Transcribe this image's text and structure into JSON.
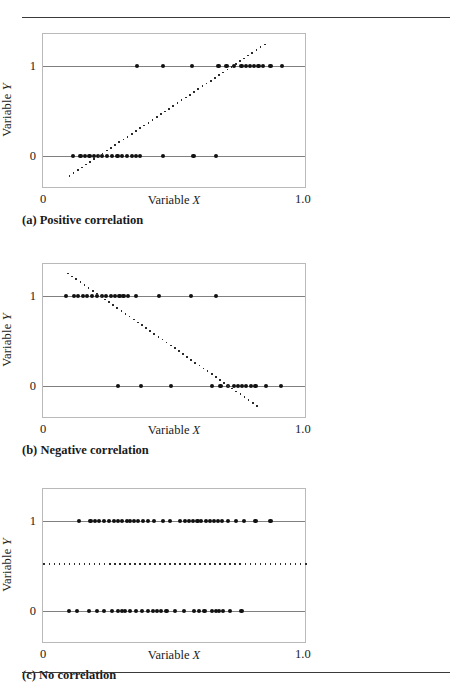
{
  "figure": {
    "rules": {
      "top": true,
      "bottom": true
    }
  },
  "panels": [
    {
      "id": "a",
      "caption": "(a) Positive correlation",
      "axis": {
        "xlabel_prefix": "Variable ",
        "xlabel_var": "X",
        "ylabel_prefix": "Variable ",
        "ylabel_var": "Y",
        "xticks": [
          "0",
          "1.0"
        ],
        "yticks": [
          "1",
          "0"
        ],
        "xlim": [
          0,
          1.0
        ],
        "ylim": [
          -0.28,
          1.28
        ]
      },
      "chart_data": {
        "type": "scatter",
        "title": "(a) Positive correlation",
        "xlabel": "Variable X",
        "ylabel": "Variable Y",
        "xlim": [
          0,
          1.0
        ],
        "ylim": [
          -0.28,
          1.28
        ],
        "grid": false,
        "legend": "none",
        "series": [
          {
            "name": "y = 1 observations",
            "y": 1,
            "x": [
              0.355,
              0.455,
              0.565,
              0.665,
              0.695,
              0.725,
              0.752,
              0.768,
              0.784,
              0.8,
              0.816,
              0.832,
              0.862,
              0.905
            ]
          },
          {
            "name": "y = 0 observations",
            "y": 0,
            "x": [
              0.115,
              0.142,
              0.158,
              0.176,
              0.192,
              0.208,
              0.224,
              0.243,
              0.262,
              0.282,
              0.3,
              0.318,
              0.336,
              0.352,
              0.368,
              0.455,
              0.57,
              0.655
            ]
          }
        ],
        "trendline": {
          "style": "dotted",
          "x0": 0.1,
          "y0": -0.22,
          "x1": 0.84,
          "y1": 1.24
        }
      }
    },
    {
      "id": "b",
      "caption": "(b) Negative correlation",
      "axis": {
        "xlabel_prefix": "Variable ",
        "xlabel_var": "X",
        "ylabel_prefix": "Variable ",
        "ylabel_var": "Y",
        "xticks": [
          "0",
          "1.0"
        ],
        "yticks": [
          "1",
          "0"
        ],
        "xlim": [
          0,
          1.0
        ],
        "ylim": [
          -0.28,
          1.28
        ]
      },
      "chart_data": {
        "type": "scatter",
        "title": "(b) Negative correlation",
        "xlabel": "Variable X",
        "ylabel": "Variable Y",
        "xlim": [
          0,
          1.0
        ],
        "ylim": [
          -0.28,
          1.28
        ],
        "grid": false,
        "legend": "none",
        "series": [
          {
            "name": "y = 1 observations",
            "y": 1,
            "x": [
              0.088,
              0.118,
              0.134,
              0.15,
              0.168,
              0.186,
              0.205,
              0.222,
              0.24,
              0.258,
              0.272,
              0.29,
              0.305,
              0.322,
              0.352,
              0.44,
              0.56,
              0.655
            ]
          },
          {
            "name": "y = 0 observations",
            "y": 0,
            "x": [
              0.285,
              0.372,
              0.485,
              0.64,
              0.672,
              0.7,
              0.725,
              0.74,
              0.755,
              0.77,
              0.788,
              0.805,
              0.845,
              0.9
            ]
          }
        ],
        "trendline": {
          "style": "dotted",
          "x0": 0.095,
          "y0": 1.25,
          "x1": 0.81,
          "y1": -0.22
        }
      }
    },
    {
      "id": "c",
      "caption": "(c) No correlation",
      "axis": {
        "xlabel_prefix": "Variable ",
        "xlabel_var": "X",
        "ylabel_prefix": "Variable ",
        "ylabel_var": "Y",
        "xticks": [
          "0",
          "1.0"
        ],
        "yticks": [
          "1",
          "0"
        ],
        "xlim": [
          0,
          1.0
        ],
        "ylim": [
          -0.28,
          1.28
        ]
      },
      "chart_data": {
        "type": "scatter",
        "title": "(c) No correlation",
        "xlabel": "Variable X",
        "ylabel": "Variable Y",
        "xlim": [
          0,
          1.0
        ],
        "ylim": [
          -0.28,
          1.28
        ],
        "grid": false,
        "legend": "none",
        "series": [
          {
            "name": "y = 1 observations",
            "y": 1,
            "x": [
              0.135,
              0.18,
              0.196,
              0.212,
              0.232,
              0.25,
              0.268,
              0.284,
              0.3,
              0.318,
              0.33,
              0.345,
              0.36,
              0.378,
              0.398,
              0.42,
              0.455,
              0.48,
              0.52,
              0.538,
              0.552,
              0.568,
              0.585,
              0.6,
              0.618,
              0.632,
              0.648,
              0.662,
              0.678,
              0.7,
              0.73,
              0.762,
              0.805,
              0.862
            ],
            "count": 34
          },
          {
            "name": "y = 0 observations",
            "y": 0,
            "x": [
              0.098,
              0.128,
              0.175,
              0.205,
              0.232,
              0.26,
              0.285,
              0.3,
              0.312,
              0.33,
              0.352,
              0.375,
              0.398,
              0.418,
              0.432,
              0.448,
              0.468,
              0.5,
              0.535,
              0.572,
              0.592,
              0.612,
              0.64,
              0.655,
              0.668,
              0.682,
              0.708,
              0.752
            ],
            "count": 28
          }
        ],
        "trendline": {
          "style": "dotted",
          "x0": 0.005,
          "y0": 0.52,
          "x1": 0.995,
          "y1": 0.52
        }
      }
    }
  ]
}
